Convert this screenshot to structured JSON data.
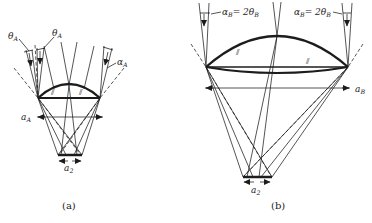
{
  "figure": {
    "panel_a": {
      "caption": "(a)",
      "theta_left": {
        "base": "θ",
        "sub": "A"
      },
      "theta_right": {
        "base": "θ",
        "sub": "A"
      },
      "alpha": {
        "base": "α",
        "sub": "A"
      },
      "aperture": {
        "base": "a",
        "sub": "A"
      },
      "focal_spot": {
        "base": "a",
        "sub": "2"
      },
      "hatch": "⫽"
    },
    "panel_b": {
      "caption": "(b)",
      "angle_left": {
        "alpha": "α",
        "alpha_sub": "B",
        "eq": "= 2",
        "theta": "θ",
        "theta_sub": "B"
      },
      "angle_right": {
        "alpha": "α",
        "alpha_sub": "B",
        "eq": "= 2",
        "theta": "θ",
        "theta_sub": "B"
      },
      "aperture": {
        "base": "a",
        "sub": "B"
      },
      "focal_spot": {
        "base": "a",
        "sub": "2"
      },
      "hatch": "⫽"
    },
    "colors": {
      "ink": "#1c1c1c",
      "background": "#ffffff"
    }
  }
}
